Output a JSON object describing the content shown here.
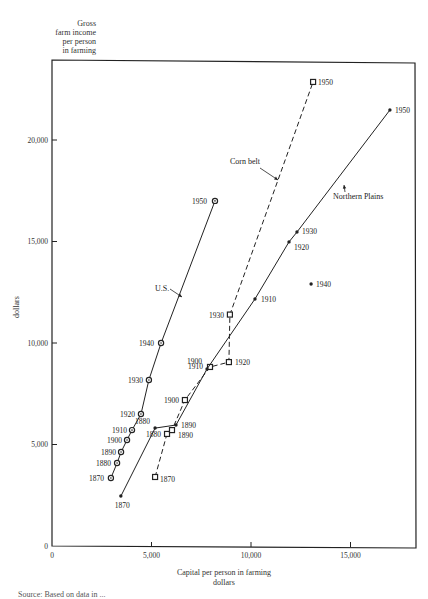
{
  "chart_data": {
    "type": "line",
    "title": "",
    "ylabel": "Gross farm income per person in farming (dollars)",
    "ylabel_lines": [
      "Gross",
      "farm income",
      "per person",
      "in farming"
    ],
    "ylabel_side": "dollars",
    "xlabel": "Capital per person in farming",
    "xlabel_unit": "dollars",
    "xlim": [
      0,
      18200
    ],
    "ylim": [
      0,
      23800
    ],
    "x_ticks": [
      {
        "value": 0,
        "label": "0"
      },
      {
        "value": 5000,
        "label": "5,000"
      },
      {
        "value": 10000,
        "label": "10,000"
      },
      {
        "value": 15000,
        "label": "15,000"
      }
    ],
    "y_ticks": [
      {
        "value": 0,
        "label": "0"
      },
      {
        "value": 5000,
        "label": "5,000"
      },
      {
        "value": 10000,
        "label": "10,000"
      },
      {
        "value": 15000,
        "label": "15,000"
      },
      {
        "value": 20000,
        "label": "20,000"
      }
    ],
    "grid": false,
    "legend_position": "inline annotations",
    "series": [
      {
        "name": "U.S.",
        "marker": "circle",
        "line": "solid",
        "points": [
          {
            "year": "1870",
            "x": 2960,
            "y": 3350
          },
          {
            "year": "1880",
            "x": 3270,
            "y": 4090
          },
          {
            "year": "1890",
            "x": 3470,
            "y": 4630
          },
          {
            "year": "1900",
            "x": 3770,
            "y": 5220
          },
          {
            "year": "1910",
            "x": 4020,
            "y": 5710
          },
          {
            "year": "1920",
            "x": 4470,
            "y": 6500
          },
          {
            "year": "1930",
            "x": 4870,
            "y": 8180
          },
          {
            "year": "1940",
            "x": 5480,
            "y": 10000
          },
          {
            "year": "1950",
            "x": 8190,
            "y": 17000
          }
        ]
      },
      {
        "name": "Corn belt",
        "marker": "square",
        "line": "dashed",
        "points": [
          {
            "year": "1870",
            "x": 5180,
            "y": 3400
          },
          {
            "year": "1880",
            "x": 5780,
            "y": 5520
          },
          {
            "year": "1890",
            "x": 6030,
            "y": 5710
          },
          {
            "year": "1900",
            "x": 6680,
            "y": 7190
          },
          {
            "year": "1910",
            "x": 7940,
            "y": 8820
          },
          {
            "year": "1920",
            "x": 8890,
            "y": 9060
          },
          {
            "year": "1930",
            "x": 8940,
            "y": 11400
          },
          {
            "year": "1950",
            "x": 13120,
            "y": 22860
          }
        ]
      },
      {
        "name": "Northern Plains",
        "marker": "dot",
        "line": "solid",
        "points": [
          {
            "year": "1870",
            "x": 3460,
            "y": 2460
          },
          {
            "year": "1880",
            "x": 5180,
            "y": 5810
          },
          {
            "year": "1890",
            "x": 6230,
            "y": 5960
          },
          {
            "year": "1900",
            "x": 7790,
            "y": 8720
          },
          {
            "year": "1910",
            "x": 10200,
            "y": 12170
          },
          {
            "year": "1920",
            "x": 11910,
            "y": 14980
          },
          {
            "year": "1930",
            "x": 12310,
            "y": 15470
          },
          {
            "year": "1940",
            "x": 13020,
            "y": 12910,
            "isolated": true
          },
          {
            "year": "1950",
            "x": 16980,
            "y": 21480
          }
        ]
      }
    ],
    "annotations": [
      "U.S.",
      "Corn belt",
      "Northern Plains"
    ]
  },
  "footer": {
    "source_text": "Source: Based on data in ..."
  }
}
